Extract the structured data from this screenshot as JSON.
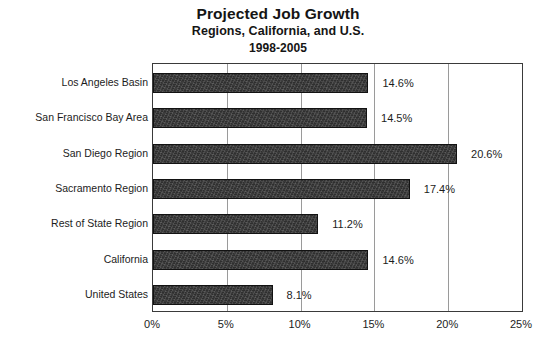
{
  "chart_data": {
    "type": "bar",
    "orientation": "horizontal",
    "title": "Projected Job Growth",
    "subtitle": "Regions, California, and U.S.",
    "subtitle2": "1998-2005",
    "xlabel": "",
    "ylabel": "",
    "xlim": [
      0,
      25
    ],
    "xticks": [
      "0%",
      "5%",
      "10%",
      "15%",
      "20%",
      "25%"
    ],
    "xtick_values": [
      0,
      5,
      10,
      15,
      20,
      25
    ],
    "grid": "vertical",
    "legend": "none",
    "bar_color": "#2f2f2f",
    "categories": [
      "Los Angeles Basin",
      "San Francisco Bay Area",
      "San Diego Region",
      "Sacramento Region",
      "Rest of State Region",
      "California",
      "United States"
    ],
    "values": [
      14.6,
      14.5,
      20.6,
      17.4,
      11.2,
      14.6,
      8.1
    ],
    "data_labels": [
      "14.6%",
      "14.5%",
      "20.6%",
      "17.4%",
      "11.2%",
      "14.6%",
      "8.1%"
    ]
  }
}
